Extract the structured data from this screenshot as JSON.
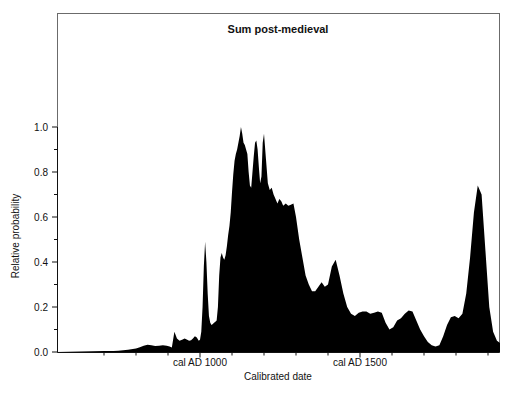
{
  "chart_data": {
    "type": "area",
    "title": "Sum post-medieval",
    "xlabel": "Calibrated date",
    "ylabel": "Relative probability",
    "grid": false,
    "legend": "none",
    "xlim": [
      700,
      1940
    ],
    "ylim": [
      0.0,
      1.0
    ],
    "x_tick_labels": [
      "cal AD 1000",
      "cal AD 1500"
    ],
    "x_tick_values": [
      1000,
      1500
    ],
    "y_tick_labels": [
      "0.0",
      "0.2",
      "0.4",
      "0.6",
      "0.8",
      "1.0"
    ],
    "y_tick_values": [
      0.0,
      0.2,
      0.4,
      0.6,
      0.8,
      1.0
    ],
    "y_minor_tick_values": [
      0.1,
      0.3,
      0.5,
      0.7,
      0.9
    ],
    "series_name": "Summed radiocarbon probability",
    "fill_color": "#000000",
    "x": [
      700,
      715,
      730,
      745,
      760,
      775,
      790,
      800,
      812,
      824,
      836,
      848,
      860,
      872,
      884,
      896,
      905,
      912,
      920,
      928,
      936,
      944,
      952,
      960,
      966,
      972,
      978,
      984,
      990,
      996,
      1000,
      1004,
      1008,
      1012,
      1016,
      1020,
      1024,
      1028,
      1032,
      1036,
      1040,
      1044,
      1048,
      1052,
      1056,
      1060,
      1064,
      1068,
      1072,
      1076,
      1080,
      1084,
      1088,
      1092,
      1096,
      1100,
      1104,
      1108,
      1112,
      1116,
      1120,
      1124,
      1128,
      1132,
      1136,
      1140,
      1144,
      1148,
      1152,
      1156,
      1160,
      1164,
      1168,
      1172,
      1176,
      1180,
      1184,
      1188,
      1192,
      1196,
      1200,
      1206,
      1212,
      1218,
      1224,
      1230,
      1236,
      1242,
      1248,
      1254,
      1260,
      1268,
      1276,
      1284,
      1292,
      1300,
      1310,
      1320,
      1330,
      1340,
      1350,
      1360,
      1370,
      1380,
      1390,
      1400,
      1412,
      1424,
      1436,
      1448,
      1460,
      1472,
      1484,
      1496,
      1508,
      1520,
      1532,
      1544,
      1556,
      1568,
      1580,
      1592,
      1604,
      1616,
      1628,
      1640,
      1652,
      1664,
      1676,
      1688,
      1700,
      1712,
      1724,
      1736,
      1748,
      1760,
      1772,
      1784,
      1796,
      1808,
      1820,
      1832,
      1844,
      1856,
      1868,
      1880,
      1892,
      1904,
      1916,
      1928,
      1940
    ],
    "y": [
      0.004,
      0.004,
      0.005,
      0.006,
      0.008,
      0.01,
      0.013,
      0.016,
      0.021,
      0.028,
      0.032,
      0.03,
      0.027,
      0.028,
      0.03,
      0.028,
      0.024,
      0.02,
      0.09,
      0.06,
      0.05,
      0.055,
      0.06,
      0.055,
      0.05,
      0.052,
      0.06,
      0.07,
      0.065,
      0.05,
      0.055,
      0.09,
      0.2,
      0.38,
      0.49,
      0.4,
      0.26,
      0.16,
      0.13,
      0.12,
      0.125,
      0.13,
      0.135,
      0.14,
      0.2,
      0.34,
      0.42,
      0.44,
      0.42,
      0.41,
      0.43,
      0.47,
      0.52,
      0.56,
      0.62,
      0.71,
      0.79,
      0.85,
      0.88,
      0.9,
      0.93,
      0.96,
      1.0,
      0.97,
      0.93,
      0.92,
      0.9,
      0.88,
      0.8,
      0.74,
      0.73,
      0.8,
      0.87,
      0.93,
      0.94,
      0.9,
      0.82,
      0.75,
      0.78,
      0.93,
      0.97,
      0.86,
      0.75,
      0.72,
      0.73,
      0.7,
      0.68,
      0.66,
      0.68,
      0.67,
      0.65,
      0.66,
      0.65,
      0.655,
      0.66,
      0.6,
      0.5,
      0.42,
      0.34,
      0.3,
      0.27,
      0.27,
      0.29,
      0.31,
      0.29,
      0.3,
      0.38,
      0.41,
      0.34,
      0.26,
      0.2,
      0.17,
      0.16,
      0.175,
      0.18,
      0.18,
      0.17,
      0.175,
      0.18,
      0.175,
      0.13,
      0.1,
      0.11,
      0.14,
      0.15,
      0.17,
      0.185,
      0.18,
      0.14,
      0.1,
      0.07,
      0.045,
      0.03,
      0.025,
      0.03,
      0.07,
      0.12,
      0.155,
      0.16,
      0.15,
      0.17,
      0.26,
      0.42,
      0.62,
      0.74,
      0.7,
      0.45,
      0.2,
      0.09,
      0.05,
      0.04,
      0.05,
      0.045,
      0.02
    ]
  },
  "axes": {
    "plot_left_px": 57,
    "plot_right_px": 500,
    "plot_top_px": 13,
    "plot_bottom_px": 353
  }
}
